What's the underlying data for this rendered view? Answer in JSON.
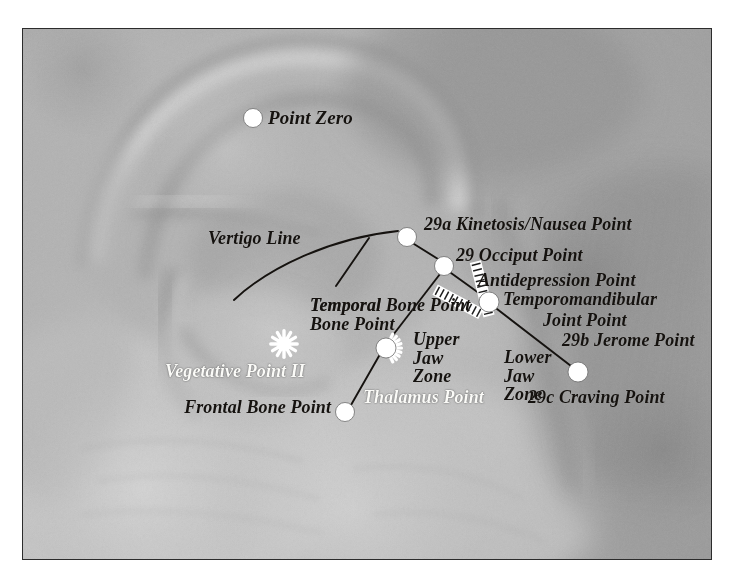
{
  "figure": {
    "kind": "auricular-acupuncture-chart",
    "frame": {
      "x": 22,
      "y": 28,
      "width": 690,
      "height": 532,
      "border_color": "#2c2c2c"
    },
    "page_background": "#ffffff"
  },
  "palette": {
    "marker_fill": "#ffffff",
    "marker_stroke": "#6d6d6d",
    "connector_line": "#15120f",
    "label_dark": "#15120f",
    "label_light": "#fbfbf8",
    "skin_light": "#c8c8c8",
    "skin_mid": "#a5a5a5",
    "skin_shadow": "#6f6f6f"
  },
  "markers": [
    {
      "id": "point-zero",
      "label": "Point Zero",
      "x": 253,
      "y": 118,
      "r": 9.5,
      "shape": "dot",
      "label_x": 268,
      "label_y": 108,
      "label_align": "left",
      "label_color": "dark",
      "size": 19
    },
    {
      "id": "kinetosis-nausea",
      "label": "29a Kinetosis/Nausea Point",
      "x": 407,
      "y": 237,
      "r": 9.5,
      "shape": "dot",
      "label_x": 424,
      "label_y": 215,
      "label_align": "left",
      "label_color": "dark",
      "size": 18
    },
    {
      "id": "occiput",
      "label": "29 Occiput Point",
      "x": 444,
      "y": 266,
      "r": 9.5,
      "shape": "dot",
      "label_x": 456,
      "label_y": 246,
      "label_align": "left",
      "label_color": "dark",
      "size": 18
    },
    {
      "id": "antidepression",
      "label": "Antidepression Point",
      "x": 489,
      "y": 302,
      "r": 10,
      "shape": "dot",
      "label_x": 478,
      "label_y": 271,
      "label_align": "left",
      "label_color": "dark",
      "size": 18
    },
    {
      "id": "temporomandibular",
      "label": "Temporomandibular",
      "x": null,
      "y": null,
      "r": 0,
      "shape": "text",
      "label_x": 503,
      "label_y": 290,
      "label_align": "left",
      "label_color": "dark",
      "size": 18
    },
    {
      "id": "tmj-joint-point",
      "label": "Joint Point",
      "x": null,
      "y": null,
      "r": 0,
      "shape": "text",
      "label_x": 543,
      "label_y": 311,
      "label_align": "left",
      "label_color": "dark",
      "size": 18
    },
    {
      "id": "jerome",
      "label": "29b Jerome Point",
      "x": null,
      "y": null,
      "r": 0,
      "shape": "text",
      "label_x": 562,
      "label_y": 331,
      "label_align": "left",
      "label_color": "dark",
      "size": 18
    },
    {
      "id": "craving",
      "label": "29c Craving Point",
      "x": 578,
      "y": 372,
      "r": 10,
      "shape": "dot",
      "label_x": 528,
      "label_y": 388,
      "label_align": "left",
      "label_color": "dark",
      "size": 18
    },
    {
      "id": "thalamus",
      "label": "Thalamus Point",
      "x": 386,
      "y": 348,
      "r": 10,
      "shape": "cog-right",
      "label_x": 363,
      "label_y": 388,
      "label_align": "left",
      "label_color": "light",
      "size": 18
    },
    {
      "id": "frontal-bone",
      "label": "Frontal Bone Point",
      "x": 345,
      "y": 412,
      "r": 9.5,
      "shape": "dot",
      "label_x": 331,
      "label_y": 398,
      "label_align": "right",
      "label_color": "dark",
      "size": 18
    },
    {
      "id": "vegetative-2",
      "label": "Vegetative Point II",
      "x": 284,
      "y": 344,
      "r": 10,
      "shape": "starburst",
      "label_x": 305,
      "label_y": 362,
      "label_align": "right",
      "label_color": "light",
      "size": 18
    },
    {
      "id": "temporal-bone",
      "label": "Temporal Bone Point",
      "x": null,
      "y": null,
      "r": 0,
      "shape": "text",
      "label_x": 310,
      "label_y": 296,
      "label_align": "left",
      "label_color": "dark",
      "size": 18
    }
  ],
  "multiline_labels": [
    {
      "id": "temporal-bone-point",
      "lines": [
        "Temporal",
        "Bone Point"
      ],
      "x": 310,
      "y": 296,
      "align": "left",
      "color": "dark",
      "size": 18
    },
    {
      "id": "upper-jaw-zone",
      "lines": [
        "Upper",
        "Jaw",
        "Zone"
      ],
      "x": 413,
      "y": 330,
      "align": "left",
      "color": "dark",
      "size": 18
    },
    {
      "id": "lower-jaw-zone",
      "lines": [
        "Lower",
        "Jaw",
        "Zone"
      ],
      "x": 504,
      "y": 348,
      "align": "left",
      "color": "dark",
      "size": 18
    }
  ],
  "line_labels": [
    {
      "id": "vertigo-line",
      "label": "Vertigo Line",
      "x": 208,
      "y": 229,
      "color": "dark",
      "size": 18
    }
  ],
  "connectors": [
    {
      "id": "vertigo-arc",
      "type": "curve",
      "d": "M 234 300 C 268 268, 330 238, 398 231",
      "width": 1.9
    },
    {
      "id": "kinetosis-to-occiput",
      "type": "line",
      "x1": 414,
      "y1": 244,
      "x2": 438,
      "y2": 259,
      "width": 1.9
    },
    {
      "id": "occiput-to-antidepr",
      "type": "line",
      "x1": 451,
      "y1": 273,
      "x2": 483,
      "y2": 296,
      "width": 1.9
    },
    {
      "id": "occiput-to-thalamus",
      "type": "line",
      "x1": 440,
      "y1": 274,
      "x2": 390,
      "y2": 339,
      "width": 1.9
    },
    {
      "id": "thalamus-to-frontal",
      "type": "line",
      "x1": 379,
      "y1": 356,
      "x2": 351,
      "y2": 405,
      "width": 1.9
    },
    {
      "id": "temporal-leader",
      "type": "line",
      "x1": 336,
      "y1": 286,
      "x2": 369,
      "y2": 238,
      "width": 1.9
    },
    {
      "id": "antidepr-to-craving",
      "type": "line",
      "x1": 497,
      "y1": 309,
      "x2": 571,
      "y2": 366,
      "width": 1.9
    }
  ],
  "hatched_zones": [
    {
      "id": "upper-jaw-zone-bar",
      "from_x": 481,
      "from_y": 314,
      "angle_deg": 208,
      "length": 52,
      "rungs": 9,
      "width": 9
    },
    {
      "id": "lower-jaw-zone-bar",
      "from_x": 489,
      "from_y": 316,
      "angle_deg": 256,
      "length": 56,
      "rungs": 9,
      "width": 9
    }
  ],
  "icon_names": [
    "dot-marker-icon",
    "starburst-marker-icon",
    "cog-marker-icon",
    "hatched-zone-bar-icon",
    "connector-line-icon",
    "vertigo-arc-icon"
  ]
}
